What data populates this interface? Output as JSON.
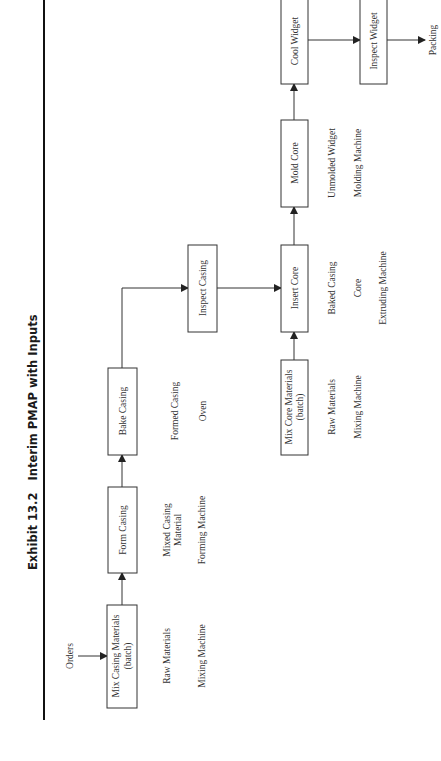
{
  "title": "Exhibit 13.2   Interim PMAP with Inputs",
  "nodes": {
    "orders": "Orders",
    "mix_casing": [
      "Mix Casing Materials",
      "(batch)"
    ],
    "form_casing": "Form Casing",
    "bake_casing": "Bake Casing",
    "inspect_casing": "Inspect Casing",
    "mix_core": [
      "Mix Core Materials",
      "(batch)"
    ],
    "insert_core": "Insert Core",
    "mold_core": "Mold Core",
    "cool_widget": "Cool Widget",
    "inspect_widget": "Inspect Widget",
    "packing": "Packing"
  },
  "inputs": {
    "mix_casing": [
      "Raw Materials",
      "Mixing Machine"
    ],
    "form_casing": [
      "Mixed Casing",
      "Material",
      "Forming Machine"
    ],
    "bake_casing": [
      "Formed Casing",
      "Oven"
    ],
    "mix_core": [
      "Raw Materials",
      "Mixing Machine"
    ],
    "insert_core": [
      "Baked Casing",
      "Core",
      "Extruding Machine"
    ],
    "mold_core": [
      "Unmolded Widget",
      "Molding Machine"
    ]
  }
}
